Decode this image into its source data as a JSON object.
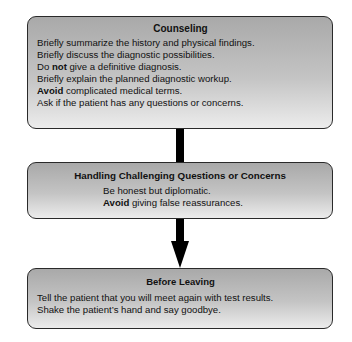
{
  "diagram": {
    "type": "flowchart",
    "boxes": [
      {
        "title": "Counseling",
        "lines": [
          {
            "pre": "",
            "bold": "",
            "post": "Briefly summarize the history and physical findings."
          },
          {
            "pre": "",
            "bold": "",
            "post": "Briefly discuss the diagnostic possibilities."
          },
          {
            "pre": "Do ",
            "bold": "not",
            "post": " give a definitive diagnosis."
          },
          {
            "pre": "",
            "bold": "",
            "post": "Briefly explain the planned diagnostic workup."
          },
          {
            "pre": "",
            "bold": "Avoid",
            "post": " complicated medical terms."
          },
          {
            "pre": "",
            "bold": "",
            "post": "Ask if the patient has any questions or concerns."
          }
        ]
      },
      {
        "title": "Handling Challenging Questions or Concerns",
        "lines": [
          {
            "pre": "",
            "bold": "",
            "post": "Be honest but diplomatic."
          },
          {
            "pre": "",
            "bold": "Avoid",
            "post": " giving false reassurances."
          }
        ]
      },
      {
        "title": "Before Leaving",
        "lines": [
          {
            "pre": "",
            "bold": "",
            "post": "Tell the patient that you will meet again with test results."
          },
          {
            "pre": "",
            "bold": "",
            "post": "Shake the patient’s hand and say goodbye."
          }
        ]
      }
    ],
    "connectors": [
      {
        "from": 0,
        "to": 1,
        "style": "line"
      },
      {
        "from": 1,
        "to": 2,
        "style": "arrow-down"
      }
    ],
    "colors": {
      "box_gradient_top": "#a9a9a9",
      "box_gradient_bottom": "#ececec",
      "border": "#2a2a2a",
      "connector": "#000000"
    }
  }
}
